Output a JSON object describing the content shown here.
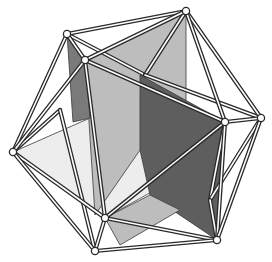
{
  "figure": {
    "width": 272,
    "height": 262,
    "colors": {
      "background": "#ffffff",
      "strut": "#2a2a2a",
      "strut_highlight": "#ffffff",
      "vertex_fill": "#ffffff",
      "plane_light": "#ededed",
      "plane_mid": "#bdbdbd",
      "plane_dark": "#7a7a7a",
      "plane_darker": "#5e5e5e"
    },
    "vertices": [
      {
        "id": "A",
        "x": 67,
        "y": 34
      },
      {
        "id": "B",
        "x": 85,
        "y": 60
      },
      {
        "id": "C",
        "x": 186,
        "y": 11
      },
      {
        "id": "D",
        "x": 225,
        "y": 122
      },
      {
        "id": "E",
        "x": 261,
        "y": 118
      },
      {
        "id": "F",
        "x": 13,
        "y": 152
      },
      {
        "id": "G",
        "x": 105,
        "y": 218
      },
      {
        "id": "H",
        "x": 95,
        "y": 251
      },
      {
        "id": "I",
        "x": 217,
        "y": 240
      }
    ],
    "hidden_vertices": [
      {
        "id": "J",
        "x": 145,
        "y": 75
      },
      {
        "id": "K",
        "x": 210,
        "y": 200
      },
      {
        "id": "L",
        "x": 60,
        "y": 110
      }
    ],
    "edges": [
      [
        "A",
        "C"
      ],
      [
        "A",
        "B"
      ],
      [
        "A",
        "F"
      ],
      [
        "A",
        "J"
      ],
      [
        "B",
        "C"
      ],
      [
        "B",
        "F"
      ],
      [
        "B",
        "G"
      ],
      [
        "B",
        "D"
      ],
      [
        "C",
        "E"
      ],
      [
        "C",
        "D"
      ],
      [
        "C",
        "J"
      ],
      [
        "D",
        "E"
      ],
      [
        "D",
        "G"
      ],
      [
        "D",
        "I"
      ],
      [
        "D",
        "K"
      ],
      [
        "E",
        "I"
      ],
      [
        "E",
        "K"
      ],
      [
        "E",
        "J"
      ],
      [
        "F",
        "G"
      ],
      [
        "F",
        "H"
      ],
      [
        "F",
        "L"
      ],
      [
        "G",
        "H"
      ],
      [
        "G",
        "I"
      ],
      [
        "H",
        "I"
      ],
      [
        "H",
        "L"
      ],
      [
        "I",
        "K"
      ]
    ],
    "planes": [
      {
        "name": "horizontal-plane",
        "shade": "plane_light",
        "points": [
          [
            13,
            152
          ],
          [
            90,
            118
          ],
          [
            225,
            122
          ],
          [
            205,
            162
          ],
          [
            105,
            218
          ]
        ]
      },
      {
        "name": "vertical-plane-front",
        "shade": "plane_mid",
        "points": [
          [
            85,
            60
          ],
          [
            186,
            11
          ],
          [
            186,
            100
          ],
          [
            140,
            150
          ],
          [
            95,
            215
          ]
        ]
      },
      {
        "name": "vertical-plane-back-left",
        "shade": "plane_dark",
        "points": [
          [
            67,
            34
          ],
          [
            85,
            60
          ],
          [
            90,
            118
          ],
          [
            73,
            122
          ]
        ]
      },
      {
        "name": "vertical-plane-right",
        "shade": "plane_darker",
        "points": [
          [
            140,
            75
          ],
          [
            225,
            122
          ],
          [
            217,
            240
          ],
          [
            150,
            195
          ],
          [
            140,
            150
          ]
        ]
      },
      {
        "name": "lower-plane-sliver",
        "shade": "plane_mid",
        "points": [
          [
            105,
            218
          ],
          [
            150,
            195
          ],
          [
            180,
            210
          ],
          [
            120,
            245
          ]
        ]
      }
    ]
  }
}
